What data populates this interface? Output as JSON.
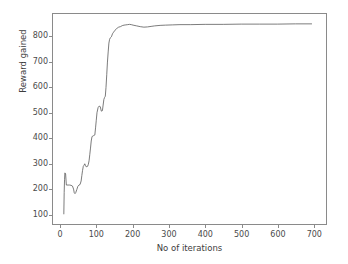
{
  "chart_data": {
    "type": "line",
    "title": "",
    "xlabel": "No of iterations",
    "ylabel": "Reward gained",
    "xlim": [
      -22,
      735
    ],
    "ylim": [
      60,
      890
    ],
    "xticks": [
      0,
      100,
      200,
      300,
      400,
      500,
      600,
      700
    ],
    "xtick_labels": [
      "0",
      "100",
      "200",
      "300",
      "400",
      "500",
      "600",
      "700"
    ],
    "yticks": [
      100,
      200,
      300,
      400,
      500,
      600,
      700,
      800
    ],
    "ytick_labels": [
      "100",
      "200",
      "300",
      "400",
      "500",
      "600",
      "700",
      "800"
    ],
    "grid": false,
    "legend": false,
    "line_color": "#5a5a5a",
    "line_width": 0.8,
    "background_color": "#ffffff",
    "axis_color": "#8a8a8a",
    "tick_label_color": "#4a4a4a",
    "series": [
      {
        "name": "Reward gained",
        "x": [
          8,
          9,
          10,
          11,
          13,
          15,
          17,
          20,
          24,
          28,
          32,
          35,
          37,
          39,
          41,
          44,
          47,
          50,
          53,
          56,
          58,
          60,
          62,
          64,
          66,
          68,
          70,
          72,
          74,
          76,
          78,
          80,
          82,
          84,
          86,
          88,
          90,
          92,
          94,
          96,
          98,
          100,
          103,
          106,
          109,
          112,
          115,
          117,
          119,
          121,
          123,
          125,
          127,
          129,
          131,
          133,
          135,
          137,
          140,
          143,
          146,
          150,
          155,
          160,
          165,
          170,
          175,
          180,
          185,
          190,
          195,
          200,
          210,
          220,
          230,
          240,
          250,
          260,
          275,
          290,
          310,
          330,
          360,
          400,
          450,
          500,
          550,
          600,
          650,
          695
        ],
        "y": [
          100,
          185,
          235,
          262,
          258,
          214,
          214,
          214,
          214,
          213,
          210,
          198,
          183,
          180,
          184,
          196,
          209,
          214,
          216,
          230,
          252,
          272,
          288,
          292,
          298,
          292,
          286,
          287,
          288,
          296,
          310,
          334,
          360,
          388,
          404,
          408,
          409,
          410,
          412,
          440,
          470,
          500,
          520,
          526,
          524,
          506,
          508,
          530,
          552,
          560,
          565,
          600,
          650,
          700,
          740,
          775,
          790,
          796,
          800,
          812,
          818,
          826,
          833,
          838,
          840,
          844,
          846,
          847,
          848,
          849,
          848,
          846,
          843,
          840,
          838,
          839,
          841,
          843,
          845,
          846,
          847,
          848,
          848,
          849,
          849,
          850,
          850,
          850,
          851,
          851
        ]
      }
    ]
  },
  "axis": {
    "xlabel": "No of iterations",
    "ylabel": "Reward gained"
  }
}
